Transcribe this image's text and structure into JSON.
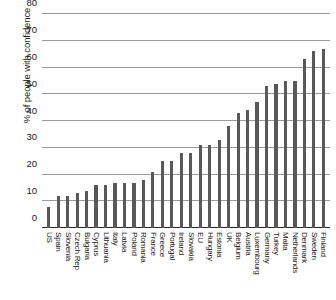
{
  "chart_data": {
    "type": "bar",
    "title": "",
    "subtitle": "",
    "xlabel": "",
    "ylabel": "% of people with confidence",
    "ylim": [
      0,
      80
    ],
    "ytick_labels": [
      "0",
      "10",
      "20",
      "30",
      "40",
      "50",
      "60",
      "70",
      "80"
    ],
    "yticks": [
      0,
      10,
      20,
      30,
      40,
      50,
      60,
      70,
      80
    ],
    "grid": true,
    "legend": null,
    "bar_color": "#585858",
    "grid_color": "#9a9a9a",
    "axis_color": "#2b2b2b",
    "categories": [
      "US",
      "Spain",
      "Slovenia",
      "Czech Rep",
      "Bulgaria",
      "Cyprus",
      "Lithuania",
      "Italy",
      "Latvia",
      "Poland",
      "Romania",
      "France",
      "Greece",
      "Portugal",
      "Ireland",
      "Slovakia",
      "EU",
      "Hungary",
      "Estonia",
      "UK",
      "Belgium",
      "Austria",
      "Luxembourg",
      "Germany",
      "Turkey",
      "Malta",
      "Netherlands",
      "Denmark",
      "Sweden",
      "Finland"
    ],
    "values": [
      8,
      12,
      12,
      13,
      14,
      16,
      16,
      17,
      17,
      17,
      18,
      21,
      25,
      25,
      28,
      28,
      31,
      31,
      33,
      38,
      43,
      44,
      47,
      53,
      54,
      55,
      55,
      63,
      66,
      67
    ]
  }
}
